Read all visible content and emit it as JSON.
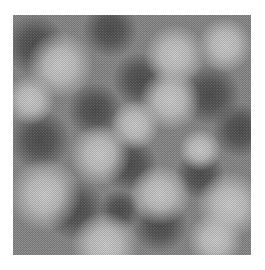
{
  "image": {
    "kind": "grayscale noise texture (halftone dithered)",
    "background": "#ffffff",
    "texture_box": {
      "x": 13,
      "y": 15,
      "width": 238,
      "height": 240
    },
    "base_gray": "#8a8a8a",
    "light_gray": "#cfcfcf",
    "dark_gray": "#4e4e4e"
  },
  "light_blobs": [
    {
      "x": 47,
      "y": 50,
      "r": 22
    },
    {
      "x": 162,
      "y": 40,
      "r": 20
    },
    {
      "x": 212,
      "y": 30,
      "r": 18
    },
    {
      "x": 157,
      "y": 85,
      "r": 20
    },
    {
      "x": 122,
      "y": 110,
      "r": 16
    },
    {
      "x": 87,
      "y": 140,
      "r": 20
    },
    {
      "x": 32,
      "y": 180,
      "r": 24
    },
    {
      "x": 147,
      "y": 180,
      "r": 20
    },
    {
      "x": 217,
      "y": 190,
      "r": 22
    },
    {
      "x": 92,
      "y": 230,
      "r": 22
    },
    {
      "x": 202,
      "y": 225,
      "r": 18
    },
    {
      "x": 17,
      "y": 85,
      "r": 16
    },
    {
      "x": 187,
      "y": 135,
      "r": 14
    }
  ],
  "dark_blobs": [
    {
      "x": 22,
      "y": 30,
      "r": 20
    },
    {
      "x": 97,
      "y": 15,
      "r": 18
    },
    {
      "x": 127,
      "y": 65,
      "r": 18
    },
    {
      "x": 82,
      "y": 95,
      "r": 18
    },
    {
      "x": 197,
      "y": 80,
      "r": 20
    },
    {
      "x": 27,
      "y": 125,
      "r": 20
    },
    {
      "x": 117,
      "y": 150,
      "r": 18
    },
    {
      "x": 62,
      "y": 195,
      "r": 20
    },
    {
      "x": 147,
      "y": 210,
      "r": 18
    },
    {
      "x": 187,
      "y": 160,
      "r": 16
    },
    {
      "x": 227,
      "y": 115,
      "r": 18
    },
    {
      "x": 107,
      "y": 195,
      "r": 14
    }
  ]
}
